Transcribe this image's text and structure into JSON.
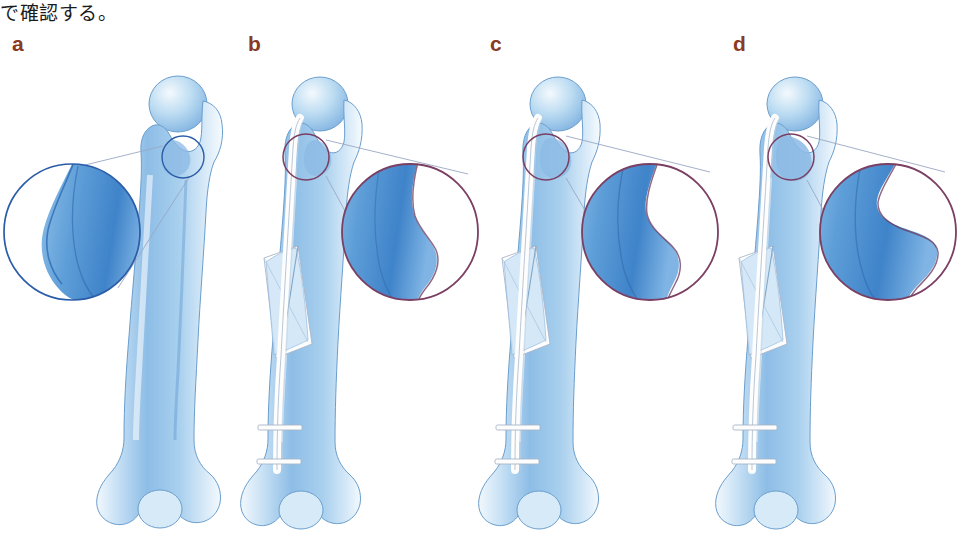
{
  "figure": {
    "caption_fragment": "で確認する。",
    "background_color": "#ffffff",
    "bone_label": "femur",
    "panel_count": 4
  },
  "colors": {
    "label_color": "#8a3a22",
    "bone_light": "#eaf3fb",
    "bone_mid": "#a8cdeb",
    "bone_deep": "#4f8fd0",
    "bone_shadow": "#2f6fb5",
    "bone_outline": "#6a9ecd",
    "magnifier_blue": "#2a5ca8",
    "magnifier_purple": "#7a3f63",
    "leader_line": "#9aa7c4",
    "implant_fill": "#fdfdfd",
    "implant_outline": "#aab6c8"
  },
  "panels": [
    {
      "id": "a",
      "label": "a",
      "label_x": 12,
      "label_y": 33,
      "description": "intact femur, neutral rotation reference",
      "has_nail": false,
      "has_fracture": false,
      "magnifier_color": "#2a5ca8",
      "magnifier_cx": 72,
      "magnifier_cy": 232,
      "magnifier_r": 68,
      "source_cx": 183,
      "source_cy": 157,
      "source_r": 21,
      "trochanter_profile": "narrow",
      "locking_screws": 0
    },
    {
      "id": "b",
      "label": "b",
      "label_x": 248,
      "label_y": 33,
      "description": "nailed femur with oblique shaft fracture, slight lesser trochanter exposure",
      "has_nail": true,
      "has_fracture": true,
      "magnifier_color": "#7a3f63",
      "magnifier_cx": 410,
      "magnifier_cy": 232,
      "magnifier_r": 68,
      "source_cx": 306,
      "source_cy": 157,
      "source_r": 23,
      "trochanter_profile": "small",
      "locking_screws": 2
    },
    {
      "id": "c",
      "label": "c",
      "label_x": 490,
      "label_y": 33,
      "description": "nailed femur, intermediate lesser trochanter profile",
      "has_nail": true,
      "has_fracture": true,
      "magnifier_color": "#7a3f63",
      "magnifier_cx": 648,
      "magnifier_cy": 232,
      "magnifier_r": 68,
      "source_cx": 551,
      "source_cy": 157,
      "source_r": 23,
      "trochanter_profile": "medium",
      "locking_screws": 2
    },
    {
      "id": "d",
      "label": "d",
      "label_x": 733,
      "label_y": 33,
      "description": "nailed femur, most prominent lesser trochanter profile",
      "has_nail": true,
      "has_fracture": true,
      "magnifier_color": "#7a3f63",
      "magnifier_cx": 888,
      "magnifier_cy": 232,
      "magnifier_r": 68,
      "source_cx": 791,
      "source_cy": 157,
      "source_r": 23,
      "trochanter_profile": "large",
      "locking_screws": 2
    }
  ]
}
